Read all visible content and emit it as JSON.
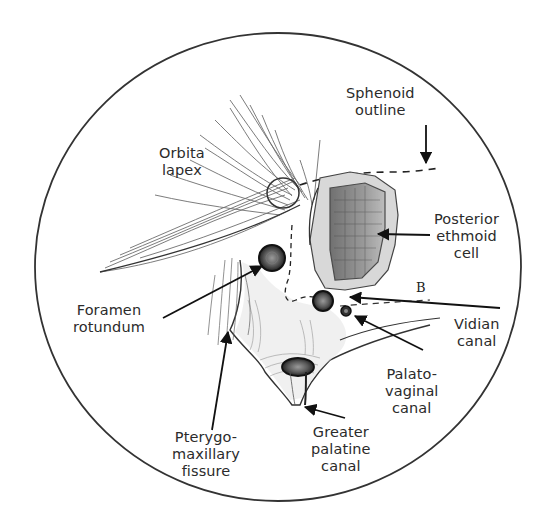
{
  "figure": {
    "view": "Endoscopic view, circular field",
    "labels": [
      {
        "id": "sphenoid-outline",
        "lines": [
          "Sphenoid",
          "outline"
        ]
      },
      {
        "id": "orbita-lapex",
        "lines": [
          "Orbita",
          "lapex"
        ]
      },
      {
        "id": "posterior-ethmoid-cell",
        "lines": [
          "Posterior",
          "ethmoid",
          "cell"
        ]
      },
      {
        "id": "foramen-rotundum",
        "lines": [
          "Foramen",
          "rotundum"
        ]
      },
      {
        "id": "vidian-canal",
        "lines": [
          "Vidian",
          "canal"
        ]
      },
      {
        "id": "palatovaginal-canal",
        "lines": [
          "Palato-",
          "vaginal",
          "canal"
        ]
      },
      {
        "id": "pterygomaxillary-fissure",
        "lines": [
          "Pterygo-",
          "maxillary",
          "fissure"
        ]
      },
      {
        "id": "greater-palatine-canal",
        "lines": [
          "Greater",
          "palatine",
          "canal"
        ]
      }
    ],
    "marker": "B",
    "colors": {
      "ink": "#2b2b2b",
      "background": "#ffffff",
      "shading": "#8a8a8a"
    }
  }
}
